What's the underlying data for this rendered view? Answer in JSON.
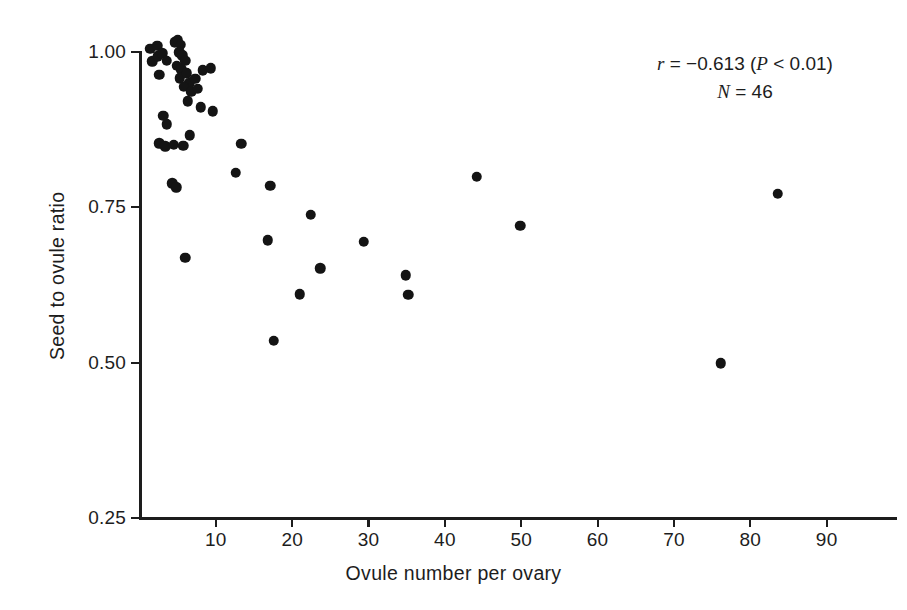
{
  "chart_data": {
    "type": "scatter",
    "title": "",
    "xlabel": "Ovule number per ovary",
    "ylabel": "Seed to ovule ratio",
    "xlim": [
      0,
      99
    ],
    "ylim": [
      0.25,
      1.02
    ],
    "grid": false,
    "legend": null,
    "x_ticks": [
      10,
      20,
      30,
      40,
      50,
      60,
      70,
      80,
      90
    ],
    "x_tick_labels": [
      "10",
      "20",
      "30",
      "40",
      "50",
      "60",
      "70",
      "80",
      "90"
    ],
    "y_ticks": [
      0.25,
      0.5,
      0.75,
      1.0
    ],
    "y_tick_labels": [
      "0.25",
      "0.50",
      "0.75",
      "1.00"
    ],
    "marker": "filled-circle",
    "marker_color": "#141414",
    "n_points": 46,
    "points": [
      {
        "x": 1.4,
        "y": 1.005
      },
      {
        "x": 1.7,
        "y": 0.985
      },
      {
        "x": 2.3,
        "y": 1.01
      },
      {
        "x": 2.4,
        "y": 0.993
      },
      {
        "x": 2.6,
        "y": 0.963
      },
      {
        "x": 3.0,
        "y": 0.998
      },
      {
        "x": 3.6,
        "y": 0.986
      },
      {
        "x": 4.6,
        "y": 1.016
      },
      {
        "x": 5.0,
        "y": 1.02
      },
      {
        "x": 5.4,
        "y": 1.012
      },
      {
        "x": 5.2,
        "y": 1.0
      },
      {
        "x": 5.6,
        "y": 0.995
      },
      {
        "x": 4.9,
        "y": 0.978
      },
      {
        "x": 5.5,
        "y": 0.972
      },
      {
        "x": 5.3,
        "y": 0.958
      },
      {
        "x": 6.0,
        "y": 0.986
      },
      {
        "x": 6.2,
        "y": 0.966
      },
      {
        "x": 6.5,
        "y": 0.95
      },
      {
        "x": 5.8,
        "y": 0.944
      },
      {
        "x": 6.8,
        "y": 0.936
      },
      {
        "x": 7.3,
        "y": 0.957
      },
      {
        "x": 7.6,
        "y": 0.941
      },
      {
        "x": 8.3,
        "y": 0.971
      },
      {
        "x": 9.3,
        "y": 0.974
      },
      {
        "x": 6.3,
        "y": 0.921
      },
      {
        "x": 8.0,
        "y": 0.911
      },
      {
        "x": 9.6,
        "y": 0.905
      },
      {
        "x": 3.1,
        "y": 0.897
      },
      {
        "x": 3.6,
        "y": 0.884
      },
      {
        "x": 2.6,
        "y": 0.853
      },
      {
        "x": 3.4,
        "y": 0.848
      },
      {
        "x": 4.5,
        "y": 0.851
      },
      {
        "x": 5.7,
        "y": 0.849
      },
      {
        "x": 6.6,
        "y": 0.866
      },
      {
        "x": 13.3,
        "y": 0.852
      },
      {
        "x": 4.3,
        "y": 0.789
      },
      {
        "x": 4.8,
        "y": 0.782
      },
      {
        "x": 12.6,
        "y": 0.806
      },
      {
        "x": 17.1,
        "y": 0.785
      },
      {
        "x": 22.4,
        "y": 0.738
      },
      {
        "x": 16.8,
        "y": 0.697
      },
      {
        "x": 29.4,
        "y": 0.695
      },
      {
        "x": 6.0,
        "y": 0.669
      },
      {
        "x": 23.7,
        "y": 0.652
      },
      {
        "x": 34.9,
        "y": 0.641
      },
      {
        "x": 21.0,
        "y": 0.61
      },
      {
        "x": 35.2,
        "y": 0.609
      },
      {
        "x": 17.6,
        "y": 0.535
      },
      {
        "x": 44.2,
        "y": 0.799
      },
      {
        "x": 49.9,
        "y": 0.72
      },
      {
        "x": 83.6,
        "y": 0.772
      },
      {
        "x": 76.1,
        "y": 0.499
      }
    ]
  },
  "annotation": {
    "correlation_symbol": "r",
    "correlation_text": " = −0.613 (",
    "p_symbol": "P",
    "p_text": " < 0.01)",
    "n_symbol": "N",
    "n_text": " = 46",
    "line1_plain": "r = −0.613 (P < 0.01)",
    "line2_plain": "N = 46"
  },
  "axes": {
    "x_title": "Ovule number per ovary",
    "y_title": "Seed to ovule ratio"
  }
}
